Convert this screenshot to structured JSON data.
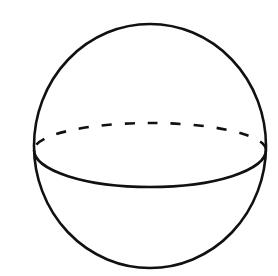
{
  "diagram": {
    "background_color": "#ffffff",
    "stroke_color": "#111111",
    "outline": {
      "cx": 150,
      "cy": 146,
      "rx": 116,
      "ry": 122,
      "stroke_width": 2.6
    },
    "equator": {
      "cx": 150,
      "cy": 150,
      "rx": 116,
      "front_ry": 37,
      "back_ry": 27,
      "front_style": "solid",
      "back_style": "dashed",
      "stroke_width": 2.6,
      "dash_pattern": "10 13"
    }
  }
}
